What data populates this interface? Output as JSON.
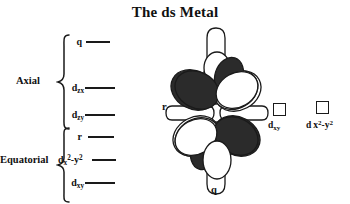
{
  "figure": {
    "title": "The ds Metal",
    "colors": {
      "ink": "#1a1a1a",
      "lobe_dark": "#2b2b2b",
      "lobe_light": "#ffffff",
      "background": "#ffffff"
    }
  },
  "energy_diagram": {
    "groups": [
      {
        "id": "axial",
        "label": "Axial"
      },
      {
        "id": "equatorial",
        "label": "Equatorial"
      }
    ],
    "levels": [
      {
        "id": "q-axial",
        "label_main": "q",
        "label_sub": "",
        "label_sup": "",
        "group": "axial",
        "y": 15,
        "line_x": 62,
        "line_w": 24
      },
      {
        "id": "dzx",
        "label_main": "d",
        "label_sub": "zx",
        "label_sup": "",
        "group": "axial",
        "y": 61,
        "line_x": 58,
        "line_w": 30
      },
      {
        "id": "dzy",
        "label_main": "d",
        "label_sub": "zy",
        "label_sup": "",
        "group": "axial",
        "y": 88,
        "line_x": 58,
        "line_w": 30
      },
      {
        "id": "r-eq",
        "label_main": "r",
        "label_sub": "",
        "label_sup": "",
        "group": "equatorial",
        "y": 110,
        "line_x": 62,
        "line_w": 26
      },
      {
        "id": "dx2-y2-eq",
        "label_main": "d",
        "label_sub": "x2-y2",
        "label_sup": "",
        "group": "equatorial",
        "y": 133,
        "line_x": 66,
        "line_w": 24
      },
      {
        "id": "dxy-eq",
        "label_main": "d",
        "label_sub": "xy",
        "label_sup": "",
        "group": "equatorial",
        "y": 156,
        "line_x": 58,
        "line_w": 30
      }
    ]
  },
  "orbital_diagram": {
    "tag_bottom": "q",
    "tag_left": "r",
    "lobes": [
      {
        "id": "lobe-upper-left",
        "fill": "dark"
      },
      {
        "id": "lobe-upper-right",
        "fill": "light"
      },
      {
        "id": "lobe-lower-left",
        "fill": "light"
      },
      {
        "id": "lobe-lower-right",
        "fill": "dark"
      },
      {
        "id": "lobe-top-vertical",
        "fill": "light"
      },
      {
        "id": "lobe-bottom-vertical",
        "fill": "light"
      },
      {
        "id": "lobe-left-horizontal",
        "fill": "light"
      },
      {
        "id": "lobe-right-horizontal",
        "fill": "light"
      },
      {
        "id": "lobe-inner-top",
        "fill": "dark"
      },
      {
        "id": "lobe-inner-bottom",
        "fill": "dark"
      }
    ]
  },
  "empty_orbitals": [
    {
      "id": "dxy-box",
      "label_main": "d",
      "label_sub": "xy",
      "label_sup": ""
    },
    {
      "id": "dx2y2-box",
      "label_main": "d",
      "label_sub": "x2-y2",
      "label_sup": ""
    }
  ],
  "labels": {
    "dxy_box_text": "dxy",
    "dx2y2_box_text": "d x2-y2"
  }
}
